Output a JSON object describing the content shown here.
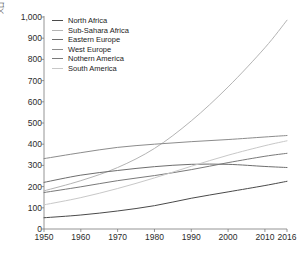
{
  "chart_data": {
    "type": "line",
    "title": "",
    "xlabel": "",
    "ylabel": "人口",
    "xlim": [
      1950,
      2016
    ],
    "ylim": [
      0,
      1000
    ],
    "grid": false,
    "legend_position": "top-left",
    "x_ticks": [
      "1950",
      "1960",
      "1970",
      "1980",
      "1990",
      "2000",
      "2010",
      "2016"
    ],
    "x_tick_values": [
      1950,
      1960,
      1970,
      1980,
      1990,
      2000,
      2010,
      2016
    ],
    "y_ticks": [
      "0",
      "100",
      "200",
      "300",
      "400",
      "500",
      "600",
      "700",
      "800",
      "900",
      "1,000"
    ],
    "y_tick_values": [
      0,
      100,
      200,
      300,
      400,
      500,
      600,
      700,
      800,
      900,
      1000
    ],
    "x": [
      1950,
      1960,
      1970,
      1980,
      1990,
      2000,
      2010,
      2016
    ],
    "series": [
      {
        "name": "North Africa",
        "color": "#4a4a4a",
        "values": [
          53,
          66,
          85,
          110,
          145,
          175,
          205,
          225
        ]
      },
      {
        "name": "Sub-Sahara Africa",
        "color": "#b4b4b4",
        "values": [
          180,
          228,
          290,
          380,
          510,
          670,
          855,
          985
        ]
      },
      {
        "name": "Eastern Europe",
        "color": "#6e6e6e",
        "values": [
          220,
          254,
          276,
          294,
          305,
          305,
          295,
          290
        ]
      },
      {
        "name": "West Europe",
        "color": "#8c8c8c",
        "values": [
          332,
          360,
          385,
          400,
          412,
          422,
          434,
          441
        ]
      },
      {
        "name": "Nothern America",
        "color": "#7a7a7a",
        "values": [
          172,
          199,
          228,
          252,
          280,
          313,
          343,
          357
        ]
      },
      {
        "name": "South America",
        "color": "#c8c8c8",
        "values": [
          114,
          148,
          191,
          241,
          296,
          348,
          393,
          416
        ]
      }
    ]
  },
  "legend": {
    "items": [
      {
        "label": "North Africa"
      },
      {
        "label": "Sub-Sahara Africa"
      },
      {
        "label": "Eastern Europe"
      },
      {
        "label": "West Europe"
      },
      {
        "label": "Nothern America"
      },
      {
        "label": "South America"
      }
    ]
  },
  "axes": {
    "axis_color": "#7a7a7a",
    "tick_color": "#2b2b2b"
  }
}
